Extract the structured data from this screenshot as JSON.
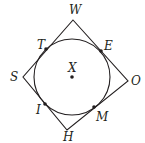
{
  "diagram": {
    "circle": {
      "center_label": "X",
      "cx": 72,
      "cy": 77,
      "r": 38
    },
    "vertices": [
      {
        "label": "W",
        "x": 73,
        "y": 20,
        "lx": 70,
        "ly": 14
      },
      {
        "label": "O",
        "x": 128,
        "y": 81,
        "lx": 131,
        "ly": 86
      },
      {
        "label": "H",
        "x": 67,
        "y": 130,
        "lx": 63,
        "ly": 142
      },
      {
        "label": "S",
        "x": 23,
        "y": 77,
        "lx": 10,
        "ly": 82
      }
    ],
    "tangent_points": [
      {
        "label": "T",
        "x": 46,
        "y": 49,
        "lx": 37,
        "ly": 48
      },
      {
        "label": "E",
        "x": 101,
        "y": 51,
        "lx": 104,
        "ly": 50
      },
      {
        "label": "M",
        "x": 94,
        "y": 107,
        "lx": 97,
        "ly": 121
      },
      {
        "label": "I",
        "x": 45,
        "y": 104,
        "lx": 36,
        "ly": 114
      }
    ],
    "colors": {
      "stroke": "#231f20",
      "background": "#ffffff"
    }
  }
}
